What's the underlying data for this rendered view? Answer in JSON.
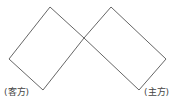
{
  "diagram": {
    "labels": {
      "left": "(客方)",
      "right": "(主方)"
    },
    "stroke_color": "#555555",
    "shapes": [
      {
        "name": "left-rectangle",
        "points": "50,7 9,59 43,90 84,38"
      },
      {
        "name": "right-rectangle",
        "points": "111,7 166,59 139,90 84,38"
      }
    ]
  }
}
